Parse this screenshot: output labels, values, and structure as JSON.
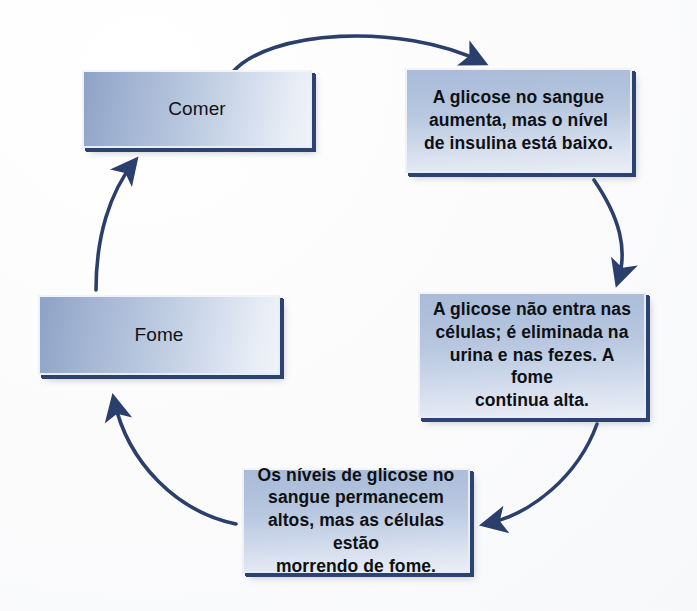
{
  "diagram": {
    "type": "cycle-flow",
    "language": "pt-BR",
    "colors": {
      "arrow": "#2a3f6b",
      "box_shadow_edge": "#2c4372",
      "box_fill_light": "#eef2f8",
      "box_fill_mid": "#a9bbd8",
      "box_fill_dark": "#8ea2c6",
      "text": "#101218",
      "background": "#fdfdfd"
    },
    "nodes": [
      {
        "id": "comer",
        "label": "Comer",
        "kind": "label"
      },
      {
        "id": "glicose-aumenta",
        "label": "A glicose no sangue\naumenta, mas o nível\nde insulina está baixo.",
        "kind": "text"
      },
      {
        "id": "glicose-nao-entra",
        "label": "A glicose não entra nas\ncélulas; é eliminada na\nurina e nas fezes. A fome\ncontinua alta.",
        "kind": "text"
      },
      {
        "id": "niveis-altos",
        "label": "Os níveis de glicose no\nsangue permanecem\naltos, mas as células estão\nmorrendo de fome.",
        "kind": "text"
      },
      {
        "id": "fome",
        "label": "Fome",
        "kind": "label"
      }
    ],
    "edges": [
      {
        "id": "comer-to-glicose-aumenta",
        "from": "comer",
        "to": "glicose-aumenta",
        "style": "curved-arrow"
      },
      {
        "id": "glicose-aumenta-to-glicose-nao-entra",
        "from": "glicose-aumenta",
        "to": "glicose-nao-entra",
        "style": "curved-arrow"
      },
      {
        "id": "glicose-nao-entra-to-niveis-altos",
        "from": "glicose-nao-entra",
        "to": "niveis-altos",
        "style": "curved-arrow"
      },
      {
        "id": "niveis-altos-to-fome",
        "from": "niveis-altos",
        "to": "fome",
        "style": "curved-arrow"
      },
      {
        "id": "fome-to-comer",
        "from": "fome",
        "to": "comer",
        "style": "curved-arrow"
      }
    ]
  }
}
